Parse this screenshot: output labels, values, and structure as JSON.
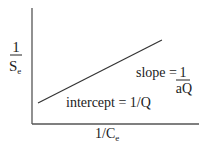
{
  "chart_data": {
    "type": "line",
    "title": "",
    "xlabel": {
      "main": "1/C",
      "sub": "e"
    },
    "ylabel": {
      "numerator": "1",
      "denominator_main": "S",
      "denominator_sub": "e"
    },
    "xlim": [
      0,
      1
    ],
    "ylim": [
      0,
      1
    ],
    "grid": false,
    "series": [
      {
        "name": "linearized isotherm",
        "x": [
          0.036,
          0.778
        ],
        "y": [
          0.181,
          0.724
        ]
      }
    ],
    "annotations": {
      "slope": {
        "prefix": "slope = ",
        "numerator": "1",
        "denominator": "aQ"
      },
      "intercept": "intercept = 1/Q"
    },
    "colors": {
      "axis": "#555555",
      "line": "#333333",
      "text": "#222222"
    }
  }
}
